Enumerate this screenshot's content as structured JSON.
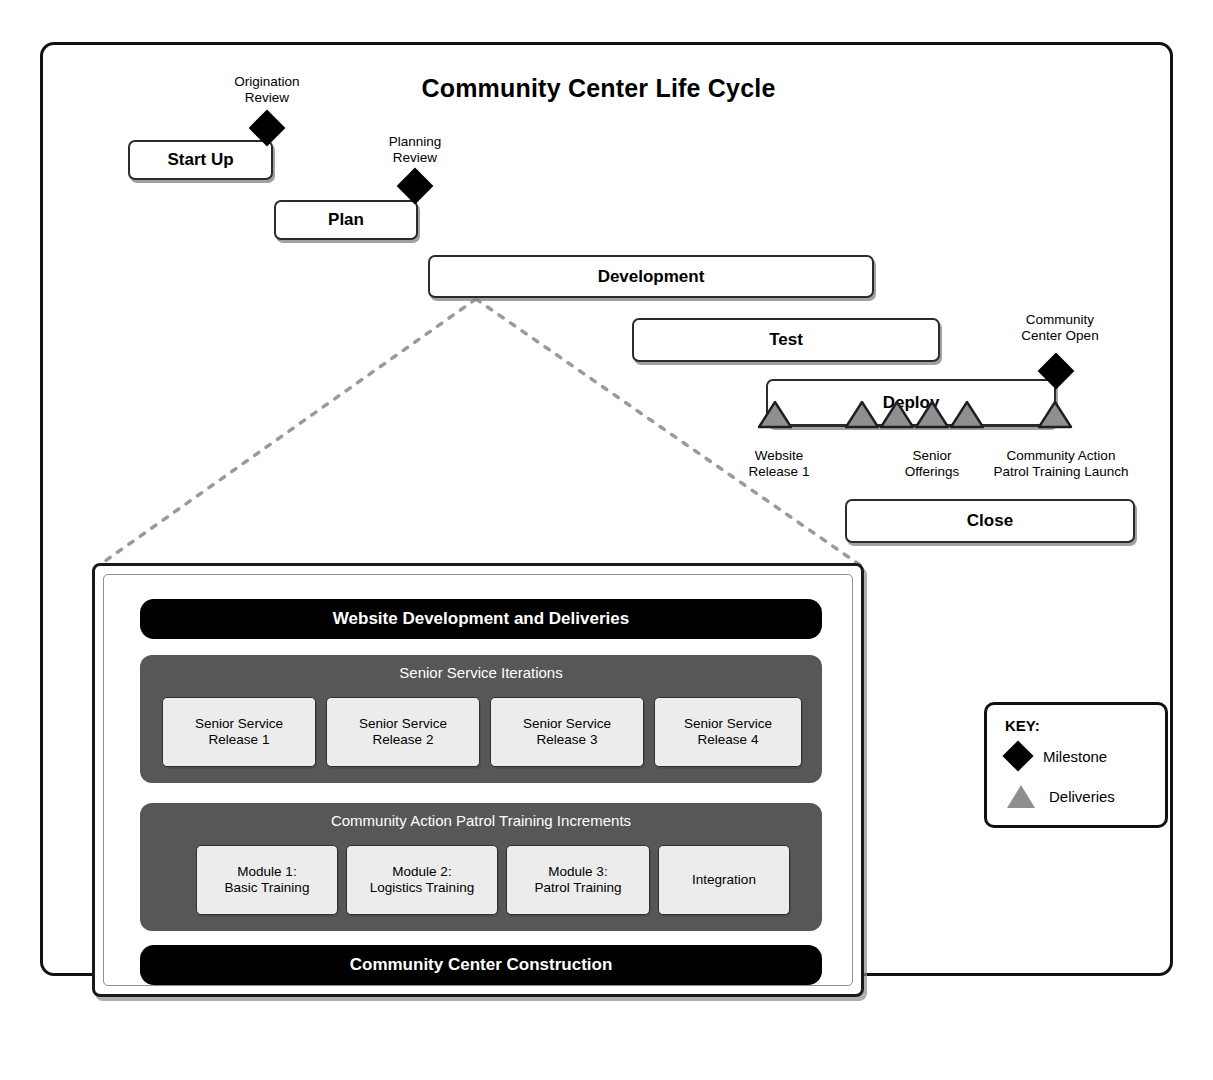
{
  "title": "Community Center Life Cycle",
  "phases": [
    {
      "label": "Start Up",
      "x": 128,
      "y": 140,
      "w": 145,
      "h": 40
    },
    {
      "label": "Plan",
      "x": 274,
      "y": 200,
      "w": 144,
      "h": 40
    },
    {
      "label": "Development",
      "x": 428,
      "y": 255,
      "w": 446,
      "h": 43
    },
    {
      "label": "Test",
      "x": 632,
      "y": 318,
      "w": 308,
      "h": 44
    },
    {
      "label": "Deploy",
      "x": 766,
      "y": 379,
      "w": 290,
      "h": 48
    },
    {
      "label": "Close",
      "x": 845,
      "y": 499,
      "w": 290,
      "h": 44
    }
  ],
  "milestones": [
    {
      "label": "Origination\nReview",
      "x": 267,
      "y": 128,
      "label_x": 267,
      "label_y": 74
    },
    {
      "label": "Planning\nReview",
      "x": 415,
      "y": 186,
      "label_x": 415,
      "label_y": 134
    },
    {
      "label": "Community\nCenter Open",
      "x": 1056,
      "y": 371,
      "label_x": 1060,
      "label_y": 312
    }
  ],
  "deliveries": [
    {
      "x": 775,
      "label": "Website\nRelease 1",
      "label_x": 779,
      "label_y": 448
    },
    {
      "x": 862,
      "label": "",
      "label_x": 0,
      "label_y": 0
    },
    {
      "x": 897,
      "label": "",
      "label_x": 0,
      "label_y": 0
    },
    {
      "x": 932,
      "label": "Senior\nOfferings",
      "label_x": 932,
      "label_y": 448
    },
    {
      "x": 967,
      "label": "",
      "label_x": 0,
      "label_y": 0
    },
    {
      "x": 1055,
      "label": "Community Action\nPatrol Training Launch",
      "label_x": 1061,
      "label_y": 448
    }
  ],
  "detail": {
    "top_band": "Website Development and Deliveries",
    "bottom_band": "Community Center Construction",
    "groups": [
      {
        "title": "Senior Service Iterations",
        "items": [
          "Senior Service\nRelease 1",
          "Senior Service\nRelease 2",
          "Senior Service\nRelease 3",
          "Senior Service\nRelease 4"
        ]
      },
      {
        "title": "Community Action Patrol Training Increments",
        "items": [
          "Module 1:\nBasic Training",
          "Module 2:\nLogistics Training",
          "Module 3:\nPatrol Training",
          "Integration"
        ]
      }
    ]
  },
  "key": {
    "title": "KEY:",
    "milestone_label": "Milestone",
    "deliveries_label": "Deliveries"
  },
  "colors": {
    "frame": "#111111",
    "bar_border": "#2b2b2b",
    "band_black": "#000000",
    "group_gray": "#575757",
    "chip_bg": "#ececec",
    "triangle": "#8f8f8f",
    "callout": "#9a9a9a"
  }
}
